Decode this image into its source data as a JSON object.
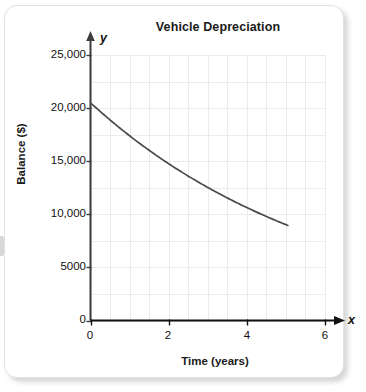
{
  "card": {
    "name": "chart-card"
  },
  "chart_data": {
    "type": "line",
    "title": "Vehicle Depreciation",
    "xlabel": "Time (years)",
    "ylabel": "Balance ($)",
    "xlim": [
      0,
      6
    ],
    "ylim": [
      0,
      25000
    ],
    "grid": true,
    "legend": null,
    "axis_letters": {
      "x": "x",
      "y": "y"
    },
    "xticks": [
      0,
      2,
      4,
      6
    ],
    "xtick_labels": [
      "0",
      "2",
      "4",
      "6"
    ],
    "yticks": [
      0,
      5000,
      10000,
      15000,
      20000,
      25000
    ],
    "ytick_labels": [
      "0",
      "5000",
      "10,000",
      "15,000",
      "20,000",
      "25,000"
    ],
    "x_minor_step": 0.5,
    "y_minor_step": 2500,
    "series": [
      {
        "name": "Balance",
        "color": "#4a4a4a",
        "x": [
          0,
          0.25,
          0.5,
          0.75,
          1,
          1.25,
          1.5,
          1.75,
          2,
          2.25,
          2.5,
          2.75,
          3,
          3.25,
          3.5,
          3.75,
          4,
          4.25,
          4.5,
          4.75,
          5,
          5.05
        ],
        "y": [
          20500,
          19840,
          19200,
          18580,
          17980,
          17400,
          16840,
          16300,
          15780,
          15270,
          14780,
          14300,
          13840,
          13390,
          12960,
          12540,
          12130,
          11740,
          11360,
          10990,
          10630,
          10560
        ]
      }
    ],
    "curve_endpoints": {
      "start": {
        "x": 0,
        "y": 20500
      },
      "end": {
        "x": 5.05,
        "y": 8950
      }
    }
  },
  "colors": {
    "card_background": "#ffffff",
    "card_border": "#e2e2e2",
    "grid": "#ebebeb",
    "axis": "#3d3d3d",
    "curve": "#4a4a4a",
    "text": "#111111"
  }
}
